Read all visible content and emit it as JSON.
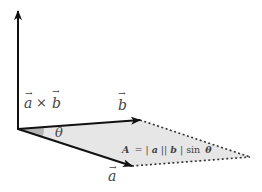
{
  "diagram": {
    "labels": {
      "cross_a": "a",
      "cross_times": "×",
      "cross_b": "b",
      "vector_b": "b",
      "vector_a": "a",
      "angle": "θ",
      "area_A": "A",
      "area_eq": "= |",
      "area_a": "a",
      "area_mid": "||",
      "area_b": "b",
      "area_end": "| sin",
      "area_theta": "θ"
    },
    "colors": {
      "arrow": "#111111",
      "fill": "#e6e6e6",
      "angle_fill": "#b5b5b5",
      "dashed": "#333333",
      "text": "#444444"
    }
  }
}
